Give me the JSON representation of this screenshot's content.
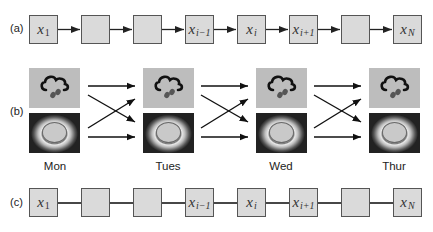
{
  "panel_a": {
    "label": "(a)",
    "edge_type": "directed",
    "nodes": [
      {
        "var": "x",
        "sub": "1"
      },
      {
        "var": "",
        "sub": ""
      },
      {
        "var": "",
        "sub": ""
      },
      {
        "var": "x",
        "sub": "i−1"
      },
      {
        "var": "x",
        "sub": "i"
      },
      {
        "var": "x",
        "sub": "i+1"
      },
      {
        "var": "",
        "sub": ""
      },
      {
        "var": "x",
        "sub": "N"
      }
    ]
  },
  "panel_b": {
    "label": "(b)",
    "states": [
      "rain-cloud-icon",
      "sun-icon"
    ],
    "days": [
      "Mon",
      "Tues",
      "Wed",
      "Thur"
    ],
    "transitions": "fully-connected (each state to each state on next day)"
  },
  "panel_c": {
    "label": "(c)",
    "edge_type": "undirected",
    "nodes": [
      {
        "var": "x",
        "sub": "1"
      },
      {
        "var": "",
        "sub": ""
      },
      {
        "var": "",
        "sub": ""
      },
      {
        "var": "x",
        "sub": "i−1"
      },
      {
        "var": "x",
        "sub": "i"
      },
      {
        "var": "x",
        "sub": "i+1"
      },
      {
        "var": "",
        "sub": ""
      },
      {
        "var": "x",
        "sub": "N"
      }
    ]
  },
  "colors": {
    "node_fill": "#dadada",
    "node_border": "#555555",
    "edge": "#222222",
    "weather_tile": "#bdbdbd"
  }
}
